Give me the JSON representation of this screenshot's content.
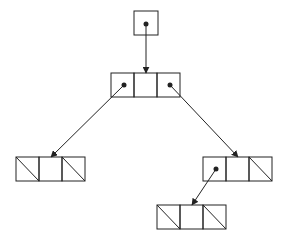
{
  "diagram": {
    "type": "binary-tree-linked-representation",
    "stroke_color": "#222222",
    "background": "#ffffff",
    "cell_size": [
      23,
      24
    ],
    "root_pointer": {
      "x": 134,
      "y": 11,
      "w": 24,
      "h": 24,
      "dot": [
        146,
        24
      ]
    },
    "nodes": [
      {
        "id": "root",
        "x": 111,
        "y": 73,
        "left": "pointer",
        "right": "pointer",
        "left_dot": [
          124,
          85
        ],
        "right_dot": [
          170,
          85
        ]
      },
      {
        "id": "left-leaf",
        "x": 16,
        "y": 157,
        "left": "null",
        "right": "null"
      },
      {
        "id": "right-child",
        "x": 203,
        "y": 157,
        "left": "pointer",
        "right": "null",
        "left_dot": [
          216,
          169
        ]
      },
      {
        "id": "right-child-left-leaf",
        "x": 157,
        "y": 205,
        "left": "null",
        "right": "null"
      }
    ],
    "edges": [
      {
        "from": "root-pointer",
        "to": "root",
        "x1": 146,
        "y1": 24,
        "x2": 146,
        "y2": 73
      },
      {
        "from": "root.left",
        "to": "left-leaf",
        "x1": 124,
        "y1": 85,
        "x2": 51,
        "y2": 157
      },
      {
        "from": "root.right",
        "to": "right-child",
        "x1": 170,
        "y1": 85,
        "x2": 238,
        "y2": 157
      },
      {
        "from": "right-child.left",
        "to": "right-child-left-leaf",
        "x1": 216,
        "y1": 169,
        "x2": 192,
        "y2": 205
      }
    ]
  }
}
